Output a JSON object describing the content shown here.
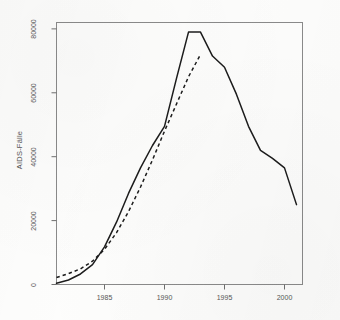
{
  "chart_data": {
    "type": "line",
    "title": "",
    "xlabel": "",
    "ylabel": "AIDS-Fälle",
    "xlim": [
      1981,
      2001.5
    ],
    "ylim": [
      0,
      82000
    ],
    "grid": false,
    "legend": "none",
    "x_ticks": [
      1985,
      1990,
      1995,
      2000
    ],
    "x_tick_labels": [
      "1985",
      "1990",
      "1995",
      "2000"
    ],
    "y_ticks": [
      0,
      20000,
      40000,
      60000,
      80000
    ],
    "y_tick_labels": [
      "0",
      "20000",
      "40000",
      "60000",
      "80000"
    ],
    "series": [
      {
        "name": "beobachtet",
        "style": "solid",
        "color": "#1c1c1c",
        "x": [
          1981,
          1982,
          1983,
          1984,
          1985,
          1986,
          1987,
          1988,
          1989,
          1990,
          1991,
          1992,
          1993,
          1994,
          1995,
          1996,
          1997,
          1998,
          1999,
          2000,
          2001
        ],
        "values": [
          400,
          1400,
          3300,
          6200,
          11800,
          19500,
          28500,
          36500,
          43500,
          49500,
          64500,
          79000,
          79000,
          71500,
          68000,
          59500,
          49500,
          42000,
          39500,
          36500,
          25000
        ]
      },
      {
        "name": "geschätzt",
        "style": "dashed",
        "color": "#1c1c1c",
        "x": [
          1981,
          1982,
          1983,
          1984,
          1985,
          1986,
          1987,
          1988,
          1989,
          1990,
          1991,
          1992,
          1993
        ],
        "values": [
          2200,
          3400,
          4900,
          7300,
          11000,
          16200,
          22800,
          30500,
          39000,
          48000,
          56500,
          65000,
          72000
        ]
      }
    ]
  },
  "axes": {
    "y_label": "AIDS-Fälle",
    "y_tick_labels": [
      "80000",
      "60000",
      "40000",
      "20000",
      "0"
    ],
    "x_tick_labels": [
      "1985",
      "1990",
      "1995",
      "2000"
    ]
  }
}
